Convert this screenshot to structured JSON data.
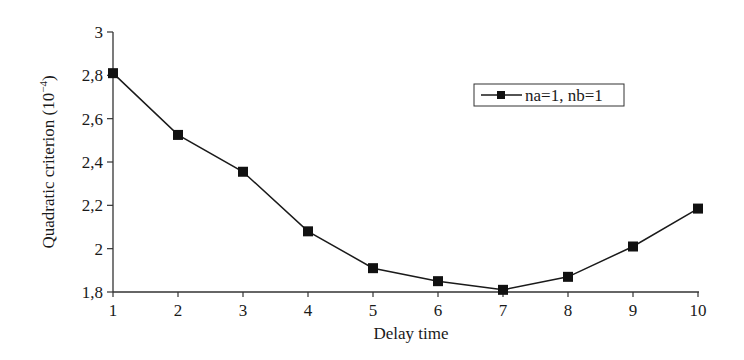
{
  "chart_data": {
    "type": "line",
    "title": "",
    "xlabel": "Delay time",
    "ylabel": "Quadratic criterion (10",
    "ylabel_exponent": "−4",
    "ylabel_suffix": ")",
    "x": [
      1,
      2,
      3,
      4,
      5,
      6,
      7,
      8,
      9,
      10
    ],
    "series": [
      {
        "name": "na=1, nb=1",
        "marker": "square",
        "color": "#1a1a1a",
        "values": [
          2.81,
          2.525,
          2.355,
          2.08,
          1.91,
          1.85,
          1.81,
          1.87,
          2.01,
          2.185
        ]
      }
    ],
    "xlim": [
      1,
      10
    ],
    "ylim": [
      1.8,
      3
    ],
    "xticks": [
      "1",
      "2",
      "3",
      "4",
      "5",
      "6",
      "7",
      "8",
      "9",
      "10"
    ],
    "yticks": [
      {
        "value": 3,
        "label": "3"
      },
      {
        "value": 2.8,
        "label": "2,8"
      },
      {
        "value": 2.6,
        "label": "2,6"
      },
      {
        "value": 2.4,
        "label": "2,4"
      },
      {
        "value": 2.2,
        "label": "2,2"
      },
      {
        "value": 2,
        "label": "2"
      },
      {
        "value": 1.8,
        "label": "1,8"
      }
    ],
    "grid": false,
    "legend_position": "upper right"
  }
}
